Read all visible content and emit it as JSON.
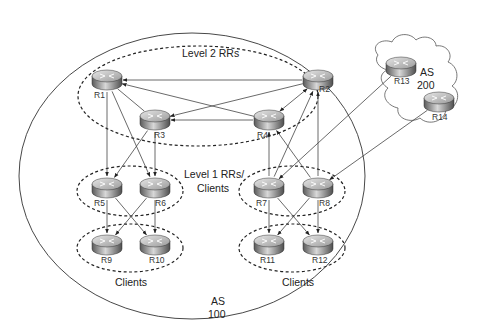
{
  "diagram": {
    "colors": {
      "line": "#444444",
      "dashed": "#222222",
      "text": "#222222",
      "router_top": "#cfcfcf",
      "router_side": "#7a7a7a"
    },
    "groups": {
      "level2": {
        "label": "Level 2 RRs"
      },
      "level1": {
        "label_line1": "Level 1 RRs/",
        "label_line2": "Clients"
      },
      "clients_left": {
        "label": "Clients"
      },
      "clients_right": {
        "label": "Clients"
      },
      "as100": {
        "label_line1": "AS",
        "label_line2": "100"
      },
      "as200": {
        "label_line1": "AS",
        "label_line2": "200"
      }
    },
    "routers": [
      {
        "id": "R1",
        "label": "R1",
        "x": 92,
        "y": 70
      },
      {
        "id": "R2",
        "label": "R2",
        "x": 303,
        "y": 70
      },
      {
        "id": "R3",
        "label": "R3",
        "x": 140,
        "y": 110
      },
      {
        "id": "R4",
        "label": "R4",
        "x": 254,
        "y": 110
      },
      {
        "id": "R5",
        "label": "R5",
        "x": 92,
        "y": 178
      },
      {
        "id": "R6",
        "label": "R6",
        "x": 140,
        "y": 178
      },
      {
        "id": "R7",
        "label": "R7",
        "x": 254,
        "y": 178
      },
      {
        "id": "R8",
        "label": "R8",
        "x": 303,
        "y": 178
      },
      {
        "id": "R9",
        "label": "R9",
        "x": 92,
        "y": 235
      },
      {
        "id": "R10",
        "label": "R10",
        "x": 140,
        "y": 235
      },
      {
        "id": "R11",
        "label": "R11",
        "x": 254,
        "y": 235
      },
      {
        "id": "R12",
        "label": "R12",
        "x": 303,
        "y": 235
      },
      {
        "id": "R13",
        "label": "R13",
        "x": 386,
        "y": 57
      },
      {
        "id": "R14",
        "label": "R14",
        "x": 424,
        "y": 92
      }
    ],
    "edges": [
      {
        "from": "R2",
        "to": "R1",
        "arrow": "end"
      },
      {
        "from": "R4",
        "to": "R1",
        "arrow": "end"
      },
      {
        "from": "R2",
        "to": "R3",
        "arrow": "end"
      },
      {
        "from": "R4",
        "to": "R3",
        "arrow": "end"
      },
      {
        "from": "R1",
        "to": "R3",
        "arrow": "none"
      },
      {
        "from": "R4",
        "to": "R2",
        "arrow": "both"
      },
      {
        "from": "R1",
        "to": "R5",
        "arrow": "end"
      },
      {
        "from": "R1",
        "to": "R6",
        "arrow": "end"
      },
      {
        "from": "R3",
        "to": "R5",
        "arrow": "end"
      },
      {
        "from": "R3",
        "to": "R6",
        "arrow": "end"
      },
      {
        "from": "R7",
        "to": "R4",
        "arrow": "end"
      },
      {
        "from": "R8",
        "to": "R4",
        "arrow": "end"
      },
      {
        "from": "R7",
        "to": "R2",
        "arrow": "end"
      },
      {
        "from": "R8",
        "to": "R2",
        "arrow": "end"
      },
      {
        "from": "R5",
        "to": "R9",
        "arrow": "end"
      },
      {
        "from": "R5",
        "to": "R10",
        "arrow": "end"
      },
      {
        "from": "R6",
        "to": "R9",
        "arrow": "end"
      },
      {
        "from": "R6",
        "to": "R10",
        "arrow": "end"
      },
      {
        "from": "R7",
        "to": "R11",
        "arrow": "end"
      },
      {
        "from": "R7",
        "to": "R12",
        "arrow": "end"
      },
      {
        "from": "R8",
        "to": "R11",
        "arrow": "end"
      },
      {
        "from": "R8",
        "to": "R12",
        "arrow": "end"
      },
      {
        "from": "R13",
        "to": "R7",
        "arrow": "end"
      },
      {
        "from": "R14",
        "to": "R8",
        "arrow": "end"
      }
    ]
  }
}
